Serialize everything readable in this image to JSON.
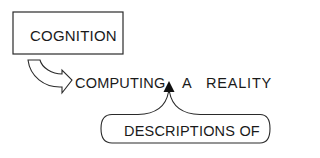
{
  "diagram": {
    "nodes": {
      "cognition": {
        "label": "COGNITION",
        "shape": "rectangle"
      },
      "computing": {
        "label": "COMPUTING"
      },
      "a": {
        "label": "A"
      },
      "reality": {
        "label": "REALITY"
      },
      "descriptions_of": {
        "label": "DESCRIPTIONS OF",
        "shape": "rounded-pill"
      }
    },
    "edges": [
      {
        "from": "cognition",
        "to": "computing",
        "style": "hollow-curved-arrow"
      },
      {
        "from": "descriptions_of",
        "to": "insertion-point",
        "style": "solid-triangle-caret",
        "position": "between COMPUTING and A"
      }
    ],
    "colors": {
      "ink": "#1a1a1a",
      "background": "#ffffff"
    }
  }
}
